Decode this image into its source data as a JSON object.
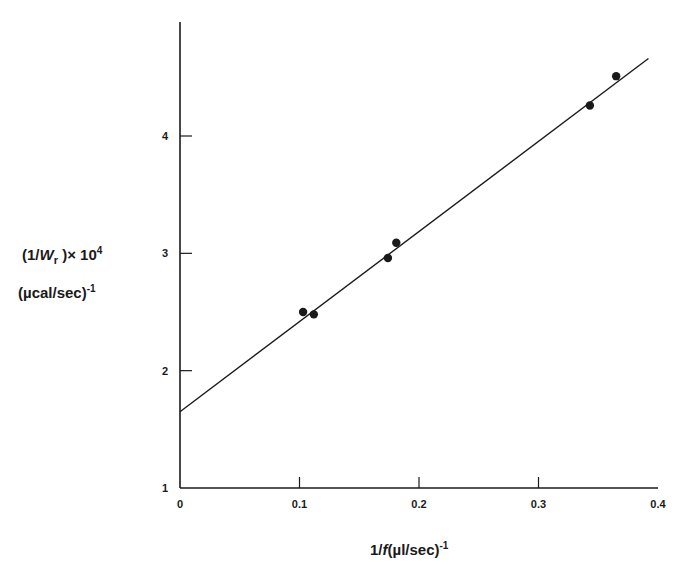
{
  "chart_data": {
    "type": "scatter",
    "title": "",
    "xlabel": "1/f (µl/sec)^-1",
    "ylabel": "(1/W_r) × 10^4 (µcal/sec)^-1",
    "xlim": [
      0,
      0.4
    ],
    "ylim": [
      1,
      5
    ],
    "grid": false,
    "legend": null,
    "x_ticks": [
      "0",
      "0.1",
      "0.2",
      "0.3",
      "0.4"
    ],
    "y_ticks": [
      "1",
      "2",
      "3",
      "4"
    ],
    "series": [
      {
        "name": "measured",
        "kind": "scatter",
        "x": [
          0.103,
          0.112,
          0.174,
          0.181,
          0.343,
          0.365
        ],
        "y": [
          2.5,
          2.48,
          2.96,
          3.09,
          4.26,
          4.51
        ]
      },
      {
        "name": "linear fit",
        "kind": "line",
        "x": [
          0,
          0.392
        ],
        "y": [
          1.65,
          4.66
        ]
      }
    ]
  },
  "labels": {
    "x_title_main": "1/",
    "x_title_f": "f",
    "x_title_units": "(µl/sec)",
    "x_title_exp": "-1",
    "y_title_line1_a": "(1/",
    "y_title_W": "W",
    "y_title_sub": "r",
    "y_title_line1_b": " )× 10",
    "y_title_exp4": "4",
    "y_title_line2": "(µcal/sec)",
    "y_title_exp": "-1"
  }
}
